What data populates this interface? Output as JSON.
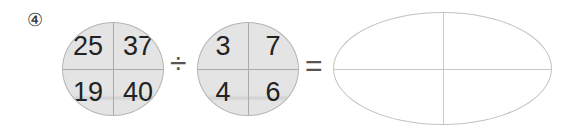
{
  "problem": {
    "number_label": "④",
    "dividend": {
      "top_left": "25",
      "top_right": "37",
      "bottom_left": "19",
      "bottom_right": "40"
    },
    "operator": "÷",
    "divisor": {
      "top_left": "3",
      "top_right": "7",
      "bottom_left": "4",
      "bottom_right": "6"
    },
    "equals": "=",
    "result": {
      "top_left": "",
      "top_right": "",
      "bottom_left": "",
      "bottom_right": ""
    }
  }
}
